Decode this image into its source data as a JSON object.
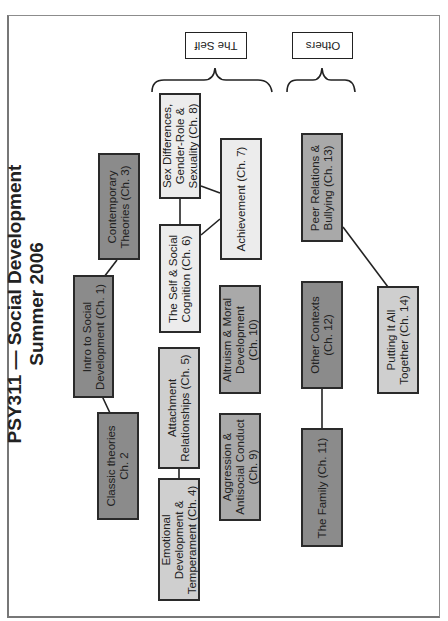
{
  "title": {
    "line1": "PSY311  — Social Development",
    "line2": "Summer 2006"
  },
  "groups": [
    {
      "label": "The Self"
    },
    {
      "label": "Others"
    }
  ],
  "nodes": [
    {
      "label": "Intro to Social\nDevelopment (Ch. 1)",
      "shade": "dark"
    },
    {
      "label": "Classic theories\nCh. 2",
      "shade": "dark"
    },
    {
      "label": "Contemporary\nTheories (Ch. 3)",
      "shade": "dark"
    },
    {
      "label": "Emotional\nDevelopment &\nTemperament (Ch. 4)",
      "shade": "light-mid"
    },
    {
      "label": "Attachment\nRelationships (Ch. 5)",
      "shade": "light-mid"
    },
    {
      "label": "The Self & Social\nCognition (Ch. 6)",
      "shade": "light"
    },
    {
      "label": "Achievement (Ch. 7)",
      "shade": "light"
    },
    {
      "label": "Sex Differences,\nGender-Role &\nSexuality (Ch. 8)",
      "shade": "light"
    },
    {
      "label": "Aggression &\nAntisocial Conduct\n(Ch. 9)",
      "shade": "mid"
    },
    {
      "label": "Altruism & Moral\nDevelopment\n(Ch. 10)",
      "shade": "mid"
    },
    {
      "label": "The Family (Ch. 11)",
      "shade": "dark"
    },
    {
      "label": "Other Contexts\n(Ch. 12)",
      "shade": "dark"
    },
    {
      "label": "Peer Relations &\nBullying (Ch. 13)",
      "shade": "mid"
    },
    {
      "label": "Putting It All\nTogether (Ch. 14)",
      "shade": "light-mid"
    }
  ],
  "colors": {
    "dark": "#8b8b8b",
    "mid": "#a9a9a9",
    "light-mid": "#cfcfcf",
    "light": "#ececec",
    "border": "#2a2a2a"
  }
}
